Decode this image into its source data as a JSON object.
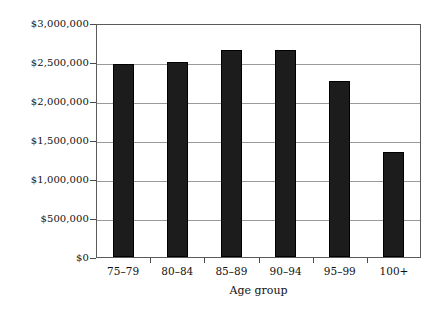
{
  "chart_data": {
    "type": "bar",
    "title": "",
    "xlabel": "Age group",
    "ylabel": "",
    "categories": [
      "75–79",
      "80–84",
      "85–89",
      "90–94",
      "95–99",
      "100+"
    ],
    "values": [
      2480000,
      2500000,
      2650000,
      2660000,
      2260000,
      1340000
    ],
    "series": [
      {
        "name": "",
        "values": [
          2480000,
          2500000,
          2650000,
          2660000,
          2260000,
          1340000
        ]
      }
    ],
    "ylim": [
      0,
      3000000
    ],
    "yticks": [
      0,
      500000,
      1000000,
      1500000,
      2000000,
      2500000,
      3000000
    ],
    "ytick_labels": [
      "$0",
      "$500,000",
      "$1,000,000",
      "$1,500,000",
      "$2,000,000",
      "$2,500,000",
      "$3,000,000"
    ],
    "grid": true,
    "grid_axis": "y",
    "legend": false,
    "legend_position": "none",
    "bar_color": "#1c1c1c",
    "grid_color": "#9a9a9a",
    "axis_color": "#5a5a5a",
    "background_color": "#ffffff"
  }
}
